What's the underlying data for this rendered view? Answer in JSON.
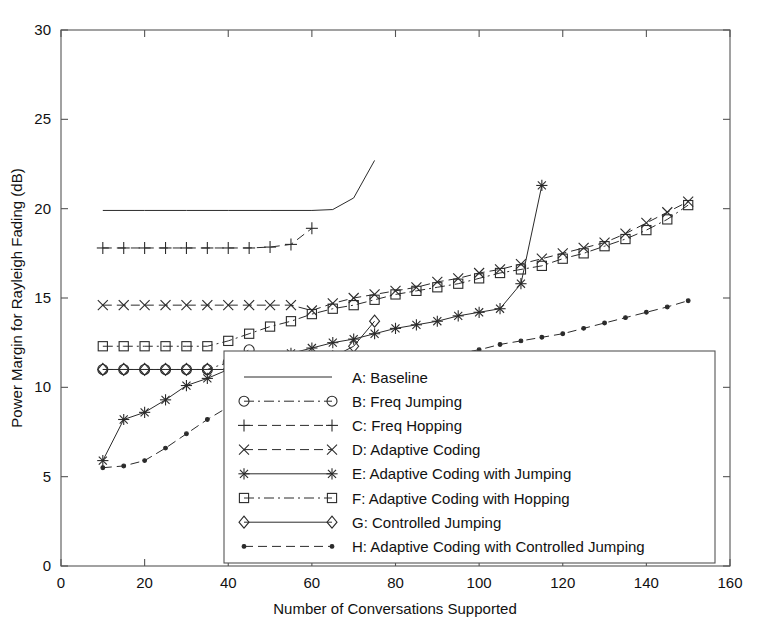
{
  "chart_data": {
    "type": "line",
    "title": "",
    "xlabel": "Number of Conversations Supported",
    "ylabel": "Power Margin for Rayleigh Fading (dB)",
    "xlim": [
      0,
      160
    ],
    "ylim": [
      0,
      30
    ],
    "xticks": [
      0,
      20,
      40,
      60,
      80,
      100,
      120,
      140,
      160
    ],
    "yticks": [
      0,
      5,
      10,
      15,
      20,
      25,
      30
    ],
    "grid": false,
    "legend_position": "lower-center-right",
    "series": [
      {
        "key": "A",
        "name": "A: Baseline",
        "marker": "none",
        "linestyle": "solid",
        "x": [
          10,
          20,
          30,
          40,
          50,
          60,
          65,
          70,
          75
        ],
        "y": [
          19.9,
          19.9,
          19.9,
          19.9,
          19.9,
          19.9,
          19.95,
          20.6,
          22.7
        ]
      },
      {
        "key": "B",
        "name": "B: Freq Jumping",
        "marker": "circle",
        "linestyle": "dashdot",
        "x": [
          10,
          15,
          20,
          25,
          30,
          35,
          40,
          45
        ],
        "y": [
          11.0,
          11.0,
          11.0,
          11.0,
          11.0,
          11.0,
          11.4,
          12.1
        ]
      },
      {
        "key": "C",
        "name": "C: Freq Hopping",
        "marker": "plus",
        "linestyle": "dashed",
        "x": [
          10,
          15,
          20,
          25,
          30,
          35,
          40,
          45,
          50,
          55,
          60
        ],
        "y": [
          17.8,
          17.8,
          17.8,
          17.8,
          17.8,
          17.8,
          17.8,
          17.8,
          17.85,
          18.0,
          18.9
        ]
      },
      {
        "key": "D",
        "name": "D: Adaptive Coding",
        "marker": "cross",
        "linestyle": "dashed",
        "x": [
          10,
          15,
          20,
          25,
          30,
          35,
          40,
          45,
          50,
          55,
          60,
          65,
          70,
          75,
          80,
          85,
          90,
          95,
          100,
          105,
          110,
          115,
          120,
          125,
          130,
          135,
          140,
          145,
          150
        ],
        "y": [
          14.6,
          14.6,
          14.6,
          14.6,
          14.6,
          14.6,
          14.6,
          14.6,
          14.6,
          14.6,
          14.3,
          14.7,
          15.0,
          15.2,
          15.4,
          15.6,
          15.9,
          16.1,
          16.4,
          16.6,
          16.9,
          17.2,
          17.5,
          17.8,
          18.1,
          18.6,
          19.2,
          19.8,
          20.4
        ]
      },
      {
        "key": "E",
        "name": "E: Adaptive Coding with Jumping",
        "marker": "asterisk",
        "linestyle": "solid",
        "x": [
          10,
          15,
          20,
          25,
          30,
          35,
          40,
          45,
          50,
          55,
          60,
          65,
          70,
          75,
          80,
          85,
          90,
          95,
          100,
          105,
          110,
          115
        ],
        "y": [
          5.9,
          8.2,
          8.6,
          9.3,
          10.1,
          10.5,
          11.0,
          11.3,
          11.6,
          11.9,
          12.2,
          12.5,
          12.7,
          13.0,
          13.3,
          13.5,
          13.7,
          14.0,
          14.2,
          14.4,
          15.8,
          21.3
        ]
      },
      {
        "key": "F",
        "name": "F: Adaptive Coding with Hopping",
        "marker": "square",
        "linestyle": "dashdot",
        "x": [
          10,
          15,
          20,
          25,
          30,
          35,
          40,
          45,
          50,
          55,
          60,
          65,
          70,
          75,
          80,
          85,
          90,
          95,
          100,
          105,
          110,
          115,
          120,
          125,
          130,
          135,
          140,
          145,
          150
        ],
        "y": [
          12.3,
          12.3,
          12.3,
          12.3,
          12.3,
          12.3,
          12.6,
          13.0,
          13.4,
          13.7,
          14.1,
          14.4,
          14.6,
          14.9,
          15.2,
          15.4,
          15.6,
          15.8,
          16.1,
          16.4,
          16.6,
          16.8,
          17.2,
          17.5,
          17.9,
          18.3,
          18.8,
          19.4,
          20.2
        ]
      },
      {
        "key": "G",
        "name": "G: Controlled Jumping",
        "marker": "diamond",
        "linestyle": "solid",
        "x": [
          10,
          15,
          20,
          25,
          30,
          35,
          40,
          45,
          50,
          55,
          60,
          65,
          70,
          75
        ],
        "y": [
          11.0,
          11.0,
          11.0,
          11.0,
          11.0,
          11.0,
          11.0,
          11.0,
          11.1,
          11.2,
          11.4,
          11.7,
          12.3,
          13.7
        ]
      },
      {
        "key": "H",
        "name": "H: Adaptive Coding with Controlled Jumping",
        "marker": "dot",
        "linestyle": "dashed",
        "x": [
          10,
          15,
          20,
          25,
          30,
          35,
          40,
          45,
          50,
          55,
          60,
          65,
          70,
          75,
          80,
          85,
          90,
          95,
          100,
          105,
          110,
          115,
          120,
          125,
          130,
          135,
          140,
          145,
          150
        ],
        "y": [
          5.5,
          5.6,
          5.9,
          6.6,
          7.4,
          8.2,
          8.9,
          9.3,
          9.7,
          10.0,
          10.3,
          10.6,
          10.9,
          11.1,
          11.3,
          11.5,
          11.7,
          11.9,
          12.1,
          12.4,
          12.6,
          12.8,
          13.0,
          13.3,
          13.6,
          13.9,
          14.2,
          14.5,
          14.85
        ]
      }
    ]
  },
  "legend": {
    "entries": [
      {
        "key": "A",
        "label": "A: Baseline"
      },
      {
        "key": "B",
        "label": "B: Freq Jumping"
      },
      {
        "key": "C",
        "label": "C: Freq Hopping"
      },
      {
        "key": "D",
        "label": "D: Adaptive Coding"
      },
      {
        "key": "E",
        "label": "E: Adaptive Coding with Jumping"
      },
      {
        "key": "F",
        "label": "F: Adaptive Coding with Hopping"
      },
      {
        "key": "G",
        "label": "G: Controlled Jumping"
      },
      {
        "key": "H",
        "label": "H: Adaptive Coding with Controlled Jumping"
      }
    ]
  },
  "colors": {
    "line": "#2b2b2b",
    "axis": "#555555",
    "background": "#ffffff",
    "text": "#111111"
  }
}
